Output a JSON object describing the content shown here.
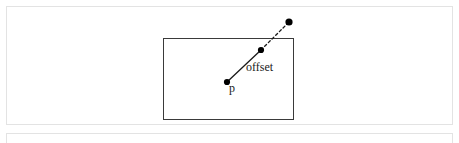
{
  "page": {
    "background_color": "#ffffff",
    "width": 459,
    "height": 143
  },
  "figure_panel": {
    "name": "offset-diagram-figure",
    "border_color": "#e3e3e3",
    "background_color": "#ffffff"
  },
  "diagram": {
    "stroke_color": "#3a3a3a",
    "point_color": "#000000",
    "rectangle": {
      "label": "bounding-rectangle",
      "x": 163,
      "y": 38,
      "width": 130,
      "height": 81
    },
    "points": [
      {
        "id": "p",
        "label": "p",
        "x": 227,
        "y": 82
      },
      {
        "id": "edge",
        "label": "",
        "x": 261,
        "y": 50
      },
      {
        "id": "target",
        "label": "",
        "x": 289,
        "y": 22
      }
    ],
    "segments": [
      {
        "id": "solid-offset-segment",
        "style": "solid",
        "from": "p",
        "to": "edge"
      },
      {
        "id": "dashed-extension-segment",
        "style": "dashed",
        "from": "edge",
        "to": "target"
      }
    ],
    "labels": [
      {
        "id": "offset-label",
        "text": "offset",
        "x": 246,
        "y": 61
      },
      {
        "id": "p-label",
        "text": "p",
        "x": 229,
        "y": 82
      }
    ]
  },
  "next_panel": {
    "name": "following-content-panel",
    "border_color": "#e3e3e3"
  }
}
